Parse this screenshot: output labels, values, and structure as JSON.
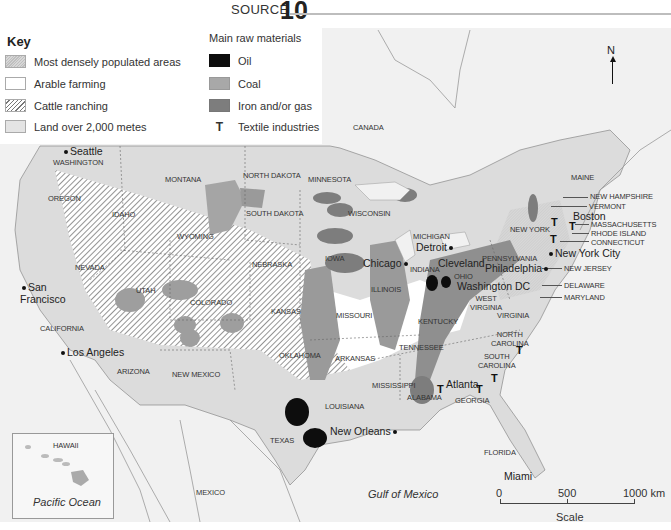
{
  "header": {
    "source_label": "SOURCE",
    "source_number": "10"
  },
  "key": {
    "title": "Key",
    "land_use": [
      {
        "label": "Most densely populated areas",
        "swatch": "dense-hatch"
      },
      {
        "label": "Arable farming",
        "swatch": "white"
      },
      {
        "label": "Cattle ranching",
        "swatch": "diagonal-hatch"
      },
      {
        "label": "Land over 2,000 metes",
        "swatch": "light-grey"
      }
    ],
    "raw_materials_title": "Main raw materials",
    "raw_materials": [
      {
        "label": "Oil",
        "color": "#0d0d0d"
      },
      {
        "label": "Coal",
        "color": "#a8a8a8"
      },
      {
        "label": "Iron and/or gas",
        "color": "#7d7d7d"
      },
      {
        "label": "Textile industries",
        "symbol": "T"
      }
    ]
  },
  "compass": {
    "label": "N"
  },
  "countries": {
    "canada": "CANADA",
    "mexico": "MEXICO"
  },
  "states": {
    "washington": "WASHINGTON",
    "oregon": "OREGON",
    "california": "CALIFORNIA",
    "nevada": "NEVADA",
    "idaho": "IDAHO",
    "montana": "MONTANA",
    "wyoming": "WYOMING",
    "utah": "UTAH",
    "arizona": "ARIZONA",
    "colorado": "COLORADO",
    "new_mexico": "NEW MEXICO",
    "north_dakota": "NORTH DAKOTA",
    "south_dakota": "SOUTH DAKOTA",
    "nebraska": "NEBRASKA",
    "kansas": "KANSAS",
    "oklahoma": "OKLAHOMA",
    "texas": "TEXAS",
    "minnesota": "MINNESOTA",
    "iowa": "IOWA",
    "missouri": "MISSOURI",
    "arkansas": "ARKANSAS",
    "louisiana": "LOUISIANA",
    "wisconsin": "WISCONSIN",
    "illinois": "ILLINOIS",
    "michigan": "MICHIGAN",
    "indiana": "INDIANA",
    "ohio": "OHIO",
    "kentucky": "KENTUCKY",
    "tennessee": "TENNESSEE",
    "mississippi": "MISSISSIPPI",
    "alabama": "ALABAMA",
    "georgia": "GEORGIA",
    "florida": "FLORIDA",
    "south_carolina": "SOUTH\nCAROLINA",
    "north_carolina": "NORTH\nCAROLINA",
    "virginia": "VIRGINIA",
    "west_virginia": "WEST\nVIRGINIA",
    "pennsylvania": "PENNSYLVANIA",
    "new_york": "NEW YORK",
    "maine": "MAINE",
    "new_hampshire": "NEW HAMPSHIRE",
    "vermont": "VERMONT",
    "massachusetts": "MASSACHUSETTS",
    "rhode_island": "RHODE ISLAND",
    "connecticut": "CONNECTICUT",
    "new_jersey": "NEW JERSEY",
    "delaware": "DELAWARE",
    "maryland": "MARYLAND",
    "hawaii": "HAWAII"
  },
  "cities": {
    "seattle": "Seattle",
    "san_francisco": "San\nFrancisco",
    "los_angeles": "Los Angeles",
    "chicago": "Chicago",
    "detroit": "Detroit",
    "cleveland": "Cleveland",
    "philadelphia": "Philadelphia",
    "washington_dc": "Washington DC",
    "new_york_city": "New York City",
    "boston": "Boston",
    "atlanta": "Atlanta",
    "new_orleans": "New Orleans",
    "miami": "Miami"
  },
  "water": {
    "pacific": "Pacific Ocean",
    "gulf": "Gulf of Mexico"
  },
  "scale": {
    "ticks": [
      "0",
      "500",
      "1000 km"
    ],
    "label": "Scale"
  },
  "textile_symbol": "T"
}
